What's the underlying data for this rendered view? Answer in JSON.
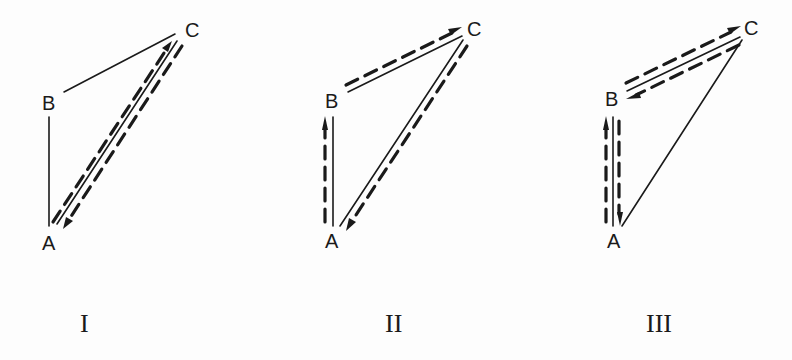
{
  "figure": {
    "diagrams": [
      {
        "id": "I",
        "numeral": "I",
        "vertices": {
          "A": "A",
          "B": "B",
          "C": "C"
        },
        "edges": [
          {
            "from": "B",
            "to": "A",
            "style": "solid"
          },
          {
            "from": "B",
            "to": "C",
            "style": "solid"
          },
          {
            "from": "A",
            "to": "C",
            "style": "solid"
          }
        ],
        "paths": [
          {
            "from": "A",
            "to": "C",
            "style": "dashed-arrow"
          },
          {
            "from": "C",
            "to": "A",
            "style": "dashed-arrow"
          }
        ]
      },
      {
        "id": "II",
        "numeral": "II",
        "vertices": {
          "A": "A",
          "B": "B",
          "C": "C"
        },
        "edges": [
          {
            "from": "B",
            "to": "A",
            "style": "solid"
          },
          {
            "from": "B",
            "to": "C",
            "style": "solid"
          },
          {
            "from": "A",
            "to": "C",
            "style": "solid"
          }
        ],
        "paths": [
          {
            "from": "A",
            "to": "B",
            "style": "dashed-arrow"
          },
          {
            "from": "B",
            "to": "C",
            "style": "dashed-arrow"
          },
          {
            "from": "C",
            "to": "A",
            "style": "dashed-arrow"
          }
        ]
      },
      {
        "id": "III",
        "numeral": "III",
        "vertices": {
          "A": "A",
          "B": "B",
          "C": "C"
        },
        "edges": [
          {
            "from": "B",
            "to": "A",
            "style": "solid"
          },
          {
            "from": "B",
            "to": "C",
            "style": "solid"
          },
          {
            "from": "A",
            "to": "C",
            "style": "solid"
          }
        ],
        "paths": [
          {
            "from": "A",
            "to": "B",
            "style": "dashed-arrow"
          },
          {
            "from": "B",
            "to": "C",
            "style": "dashed-arrow"
          },
          {
            "from": "C",
            "to": "B",
            "style": "dashed-arrow"
          },
          {
            "from": "B",
            "to": "A",
            "style": "dashed-arrow"
          }
        ]
      }
    ]
  }
}
